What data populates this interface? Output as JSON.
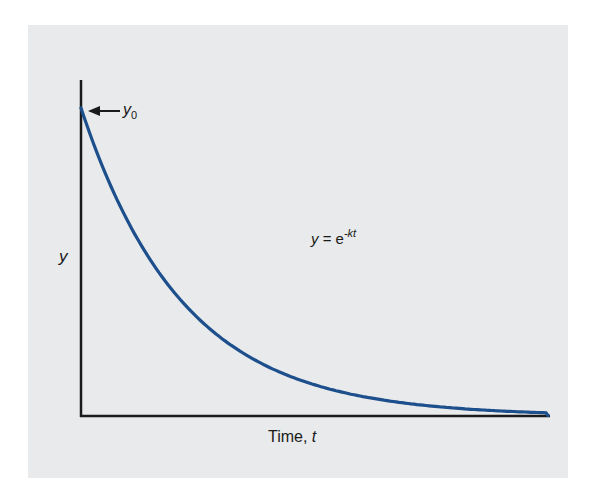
{
  "chart_data": {
    "type": "line",
    "title": "",
    "xlabel": "Time, t",
    "ylabel": "y",
    "equation": "y = e^-kt",
    "annotations": [
      {
        "text": "y0",
        "target": "initial value at t=0",
        "arrow": "left"
      },
      {
        "text": "y = e^-kt",
        "position": "center-right"
      }
    ],
    "ticks": {
      "x": [],
      "y": []
    },
    "grid": false,
    "legend": null,
    "series": [
      {
        "name": "y = e^-kt",
        "color": "#1d4f8c",
        "x": [
          0,
          0.1,
          0.2,
          0.3,
          0.4,
          0.5,
          0.6,
          0.7,
          0.8,
          0.9,
          1.0
        ],
        "values": [
          1.0,
          0.63,
          0.4,
          0.25,
          0.16,
          0.1,
          0.063,
          0.04,
          0.025,
          0.016,
          0.0
        ]
      }
    ],
    "xlim": [
      0,
      1
    ],
    "ylim": [
      0,
      1.0
    ]
  },
  "labels": {
    "y0_main": "y",
    "y0_sub": "0",
    "eq_lhs": "y",
    "eq_eq": " = e",
    "eq_exp": "-kt",
    "xlabel_text": "Time, ",
    "xlabel_var": "t",
    "ylabel": "y"
  },
  "colors": {
    "panel": "#e8eaeb",
    "axis": "#1a1a1a",
    "curve": "#1d4f8c"
  }
}
